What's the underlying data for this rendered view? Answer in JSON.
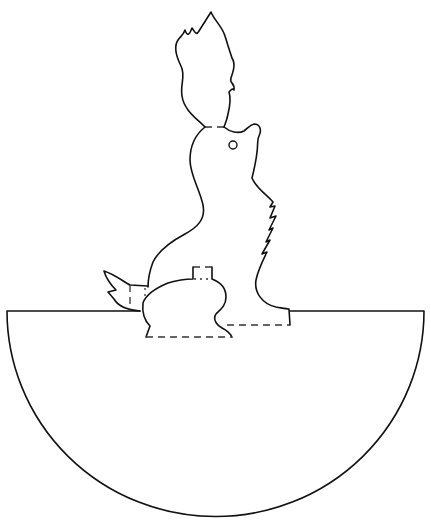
{
  "figure": {
    "title": "Squirrel papercraft cut-out template",
    "subject": "squirrel",
    "colors": {
      "line": "#111111",
      "fold_line": "#333333",
      "background": "#ffffff"
    },
    "parts": [
      {
        "name": "tail-flame",
        "type": "cut-line"
      },
      {
        "name": "squirrel-body",
        "type": "cut-line"
      },
      {
        "name": "squirrel-eye",
        "type": "cut-line"
      },
      {
        "name": "back-tail-tip",
        "type": "cut-line"
      },
      {
        "name": "hind-leg",
        "type": "cut-line"
      },
      {
        "name": "semicircle-base",
        "type": "cut-line"
      },
      {
        "name": "neck-fold",
        "type": "fold-line"
      },
      {
        "name": "leg-fold",
        "type": "fold-line"
      },
      {
        "name": "base-folds",
        "type": "fold-line"
      }
    ]
  }
}
